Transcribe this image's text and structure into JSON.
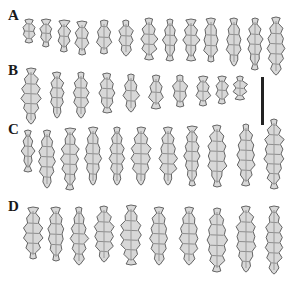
{
  "figure": {
    "background": "#ffffff",
    "label_color": "#1a1a1a",
    "sclerite_fill": "#d8d8d8",
    "sclerite_stroke": "#555555",
    "rows": [
      {
        "label": "A",
        "label_pos": {
          "x": 8,
          "y": 8
        },
        "sclerites": [
          {
            "x": 29,
            "y": 20,
            "h": 22,
            "w": 9
          },
          {
            "x": 46,
            "y": 20,
            "h": 26,
            "w": 8
          },
          {
            "x": 64,
            "y": 21,
            "h": 30,
            "w": 8
          },
          {
            "x": 82,
            "y": 22,
            "h": 32,
            "w": 9
          },
          {
            "x": 104,
            "y": 21,
            "h": 32,
            "w": 10
          },
          {
            "x": 126,
            "y": 21,
            "h": 34,
            "w": 10
          },
          {
            "x": 149,
            "y": 19,
            "h": 40,
            "w": 10
          },
          {
            "x": 170,
            "y": 20,
            "h": 40,
            "w": 9
          },
          {
            "x": 191,
            "y": 20,
            "h": 40,
            "w": 10
          },
          {
            "x": 211,
            "y": 19,
            "h": 42,
            "w": 11
          },
          {
            "x": 234,
            "y": 19,
            "h": 46,
            "w": 11
          },
          {
            "x": 255,
            "y": 19,
            "h": 50,
            "w": 10
          },
          {
            "x": 276,
            "y": 18,
            "h": 56,
            "w": 12
          }
        ]
      },
      {
        "label": "B",
        "label_pos": {
          "x": 8,
          "y": 63
        },
        "sclerites": [
          {
            "x": 31,
            "y": 69,
            "h": 54,
            "w": 13
          },
          {
            "x": 57,
            "y": 73,
            "h": 44,
            "w": 10
          },
          {
            "x": 81,
            "y": 73,
            "h": 44,
            "w": 11
          },
          {
            "x": 107,
            "y": 74,
            "h": 38,
            "w": 11
          },
          {
            "x": 131,
            "y": 75,
            "h": 36,
            "w": 10
          },
          {
            "x": 156,
            "y": 76,
            "h": 32,
            "w": 9
          },
          {
            "x": 180,
            "y": 76,
            "h": 30,
            "w": 10
          },
          {
            "x": 203,
            "y": 77,
            "h": 28,
            "w": 9
          },
          {
            "x": 222,
            "y": 77,
            "h": 26,
            "w": 8
          },
          {
            "x": 240,
            "y": 77,
            "h": 22,
            "w": 8
          }
        ]
      },
      {
        "label": "C",
        "label_pos": {
          "x": 8,
          "y": 122
        },
        "sclerites": [
          {
            "x": 28,
            "y": 131,
            "h": 40,
            "w": 7
          },
          {
            "x": 47,
            "y": 131,
            "h": 56,
            "w": 12
          },
          {
            "x": 70,
            "y": 129,
            "h": 60,
            "w": 12
          },
          {
            "x": 93,
            "y": 128,
            "h": 56,
            "w": 12
          },
          {
            "x": 117,
            "y": 128,
            "h": 56,
            "w": 10
          },
          {
            "x": 141,
            "y": 128,
            "h": 56,
            "w": 14
          },
          {
            "x": 168,
            "y": 128,
            "h": 56,
            "w": 12
          },
          {
            "x": 192,
            "y": 127,
            "h": 58,
            "w": 11
          },
          {
            "x": 217,
            "y": 126,
            "h": 60,
            "w": 14
          },
          {
            "x": 246,
            "y": 125,
            "h": 60,
            "w": 13
          },
          {
            "x": 274,
            "y": 120,
            "h": 68,
            "w": 14
          }
        ]
      },
      {
        "label": "D",
        "label_pos": {
          "x": 8,
          "y": 199
        },
        "sclerites": [
          {
            "x": 33,
            "y": 208,
            "h": 50,
            "w": 13
          },
          {
            "x": 56,
            "y": 208,
            "h": 52,
            "w": 12
          },
          {
            "x": 79,
            "y": 208,
            "h": 56,
            "w": 11
          },
          {
            "x": 104,
            "y": 207,
            "h": 54,
            "w": 14
          },
          {
            "x": 131,
            "y": 206,
            "h": 58,
            "w": 15
          },
          {
            "x": 159,
            "y": 208,
            "h": 56,
            "w": 13
          },
          {
            "x": 189,
            "y": 208,
            "h": 56,
            "w": 14
          },
          {
            "x": 217,
            "y": 209,
            "h": 62,
            "w": 15
          },
          {
            "x": 246,
            "y": 207,
            "h": 64,
            "w": 15
          },
          {
            "x": 274,
            "y": 207,
            "h": 66,
            "w": 12
          }
        ]
      }
    ],
    "scale_bar": {
      "x": 261,
      "y": 77,
      "height": 48,
      "color": "#222222"
    }
  }
}
